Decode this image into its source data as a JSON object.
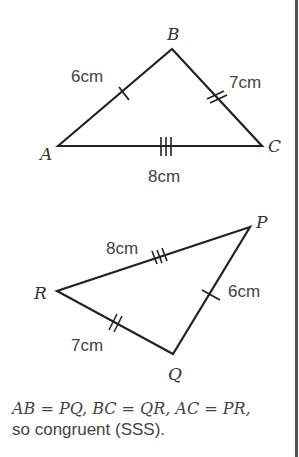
{
  "diagram": {
    "triangle1": {
      "vertices": {
        "A": "A",
        "B": "B",
        "C": "C"
      },
      "sides": {
        "AB": "6cm",
        "BC": "7cm",
        "AC": "8cm"
      }
    },
    "triangle2": {
      "vertices": {
        "P": "P",
        "Q": "Q",
        "R": "R"
      },
      "sides": {
        "PR": "8cm",
        "PQ": "6cm",
        "QR": "7cm"
      }
    },
    "caption": {
      "line1": "AB = PQ, BC = QR, AC = PR,",
      "line2": "so congruent (SSS)."
    }
  }
}
